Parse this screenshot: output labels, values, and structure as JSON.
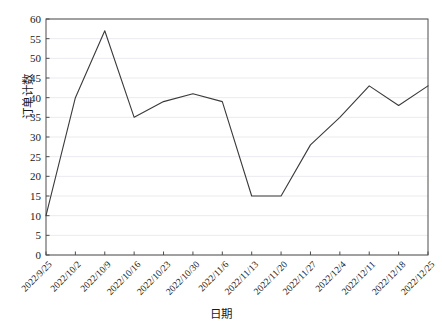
{
  "chart_data": {
    "type": "line",
    "title": "",
    "xlabel": "日期",
    "ylabel": "订单计数",
    "grid": true,
    "legend": false,
    "xlim_categories": 14,
    "ylim": [
      0,
      60
    ],
    "ytick_step": 5,
    "yticks": [
      0,
      5,
      10,
      15,
      20,
      25,
      30,
      35,
      40,
      45,
      50,
      55,
      60
    ],
    "categories": [
      "2022/9/25",
      "2022/10/2",
      "2022/10/9",
      "2022/10/16",
      "2022/10/23",
      "2022/10/30",
      "2022/11/6",
      "2022/11/13",
      "2022/11/20",
      "2022/11/27",
      "2022/12/4",
      "2022/12/11",
      "2022/12/18",
      "2022/12/25"
    ],
    "series": [
      {
        "name": "订单计数",
        "values": [
          10,
          40,
          57,
          35,
          39,
          41,
          39,
          15,
          15,
          28,
          35,
          43,
          38,
          43
        ],
        "color": "#3a3a3a"
      }
    ]
  },
  "style": {
    "line_color": "#3a3a3a",
    "grid_color": "#ebebf0",
    "axis_color": "#4d4d4d",
    "plot_bg": "#ffffff",
    "text_color": "#1a1a1a"
  }
}
